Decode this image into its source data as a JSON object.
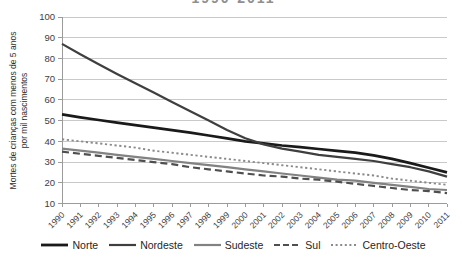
{
  "title_clipped": "1990-2011",
  "y_axis": {
    "label_line1": "Mortes de crianças com menos de 5 anos",
    "label_line2": "por mil nascimentos",
    "ticks": [
      100,
      90,
      80,
      70,
      60,
      50,
      40,
      30,
      20,
      10
    ]
  },
  "chart_data": {
    "type": "line",
    "x": [
      1990,
      1991,
      1992,
      1993,
      1994,
      1995,
      1996,
      1997,
      1998,
      1999,
      2000,
      2001,
      2002,
      2003,
      2004,
      2005,
      2006,
      2007,
      2008,
      2009,
      2010,
      2011
    ],
    "series": [
      {
        "name": "Norte",
        "color": "#1a1a1a",
        "line_style": "solid-thick",
        "values": [
          53,
          51.6,
          50.3,
          49,
          47.8,
          46.6,
          45.4,
          44.2,
          42.8,
          41.4,
          40,
          39,
          38,
          37.2,
          36.3,
          35.4,
          34.5,
          33.2,
          31.5,
          29.5,
          27.3,
          25
        ]
      },
      {
        "name": "Nordeste",
        "color": "#3f3f3f",
        "line_style": "solid",
        "values": [
          87,
          82,
          77.2,
          72.5,
          68,
          63.5,
          59,
          54.5,
          50,
          45.5,
          41.5,
          38.5,
          36.5,
          35,
          33.5,
          32.5,
          31.5,
          30.5,
          29,
          27.5,
          25.5,
          23
        ]
      },
      {
        "name": "Sudeste",
        "color": "#828282",
        "line_style": "solid",
        "values": [
          36.5,
          35.5,
          34.5,
          33.5,
          32.5,
          31.5,
          30.5,
          29.5,
          28.5,
          27.5,
          26.5,
          25.5,
          24.5,
          23.5,
          22.5,
          21.5,
          21,
          20,
          19,
          18,
          17,
          16.5
        ]
      },
      {
        "name": "Sul",
        "color": "#4f4f4f",
        "line_style": "dashed",
        "values": [
          35,
          34,
          33,
          32,
          31,
          30,
          29,
          27.5,
          26.5,
          25.5,
          24.5,
          23.5,
          23,
          22,
          21.5,
          20.5,
          19.5,
          18.5,
          17.5,
          16.5,
          16,
          15
        ]
      },
      {
        "name": "Centro-Oeste",
        "color": "#8a8a8a",
        "line_style": "dotted",
        "values": [
          41,
          40,
          39,
          38,
          37,
          35.5,
          34.5,
          33.5,
          32.5,
          31.5,
          30.5,
          29.5,
          28.5,
          27.5,
          26.5,
          25.5,
          24.5,
          23.5,
          22,
          21,
          20,
          19
        ]
      }
    ],
    "title": "1990-2011",
    "xlabel": "",
    "ylabel": "Mortes de crianças com menos de 5 anos por mil nascimentos",
    "ylim": [
      10,
      100
    ],
    "grid": "horizontal",
    "legend_position": "bottom"
  },
  "colors": {
    "gridline": "#c9c9c9",
    "axis": "#9b9b9b",
    "tick_text": "#3d3d3d"
  }
}
